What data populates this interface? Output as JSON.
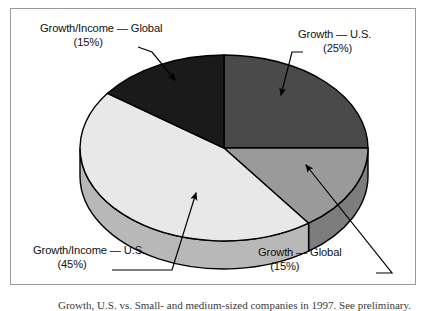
{
  "figure": {
    "frame_border_color": "#9a9a9a",
    "background": "#ffffff"
  },
  "chart_data": {
    "type": "pie",
    "title": "",
    "three_d": true,
    "start_angle_deg": 0,
    "direction": "clockwise",
    "legend": "callout-labels",
    "categories": [
      "Growth — U.S.",
      "Growth — Global",
      "Growth/Income — U.S.",
      "Growth/Income — Global"
    ],
    "values": [
      25,
      15,
      45,
      15
    ],
    "value_unit": "%",
    "colors": [
      "#4a4a4a",
      "#9a9a9a",
      "#e8e8e8",
      "#1a1a1a"
    ],
    "side_colors": [
      "#3a3a3a",
      "#7d7d7d",
      "#b8b8b8",
      "#151515"
    ],
    "slices": [
      {
        "label": "Growth — U.S.",
        "percent_text": "(25%)",
        "value": 25,
        "color": "#4a4a4a"
      },
      {
        "label": "Growth — Global",
        "percent_text": "(15%)",
        "value": 15,
        "color": "#9a9a9a"
      },
      {
        "label": "Growth/Income — U.S.",
        "percent_text": "(45%)",
        "value": 45,
        "color": "#e8e8e8"
      },
      {
        "label": "Growth/Income — Global",
        "percent_text": "(15%)",
        "value": 15,
        "color": "#1a1a1a"
      }
    ]
  },
  "labels": {
    "growth_income_global": {
      "name": "Growth/Income — Global",
      "percent": "(15%)"
    },
    "growth_us": {
      "name": "Growth — U.S.",
      "percent": "(25%)"
    },
    "growth_income_us": {
      "name": "Growth/Income — U.S.",
      "percent": "(45%)"
    },
    "growth_global": {
      "name": "Growth — Global",
      "percent": "(15%)"
    }
  },
  "caption": {
    "text": "Growth, U.S. vs. Small- and medium-sized companies in 1997. See preliminary."
  }
}
